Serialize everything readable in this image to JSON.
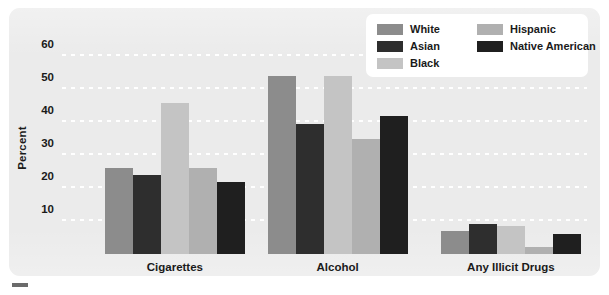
{
  "chart_data": {
    "type": "bar",
    "title": "",
    "xlabel": "",
    "ylabel": "Percent",
    "ylim": [
      0,
      65
    ],
    "yticks": [
      10,
      20,
      30,
      40,
      50,
      60
    ],
    "grid": true,
    "legend_position": "top-right",
    "categories": [
      "Cigarettes",
      "Alcohol",
      "Any Illicit Drugs"
    ],
    "series": [
      {
        "name": "White",
        "color": "#8c8c8c",
        "values": [
          26,
          54,
          7
        ]
      },
      {
        "name": "Asian",
        "color": "#2e2e2e",
        "values": [
          24,
          39.5,
          9
        ]
      },
      {
        "name": "Black",
        "color": "#c4c4c4",
        "values": [
          46,
          54,
          8.5
        ]
      },
      {
        "name": "Hispanic",
        "color": "#b0b0b0",
        "values": [
          26,
          35,
          2
        ]
      },
      {
        "name": "Native American",
        "color": "#1f1f1f",
        "values": [
          22,
          42,
          6
        ]
      }
    ]
  },
  "axis": {
    "y_label": "Percent",
    "y_ticks": [
      "60",
      "50",
      "40",
      "30",
      "20",
      "10"
    ],
    "x_ticks": [
      "Cigarettes",
      "Alcohol",
      "Any Illicit Drugs"
    ]
  },
  "legend": {
    "left_column": [
      {
        "label": "White",
        "color": "#8c8c8c"
      },
      {
        "label": "Asian",
        "color": "#2e2e2e"
      },
      {
        "label": "Black",
        "color": "#c4c4c4"
      }
    ],
    "right_column": [
      {
        "label": "Hispanic",
        "color": "#b0b0b0"
      },
      {
        "label": "Native American",
        "color": "#1f1f1f"
      }
    ]
  },
  "colors": {
    "panel_background": "#ebebeb",
    "gridline": "#ffffff",
    "text": "#1a1a1a",
    "legend_background": "#ffffff"
  }
}
